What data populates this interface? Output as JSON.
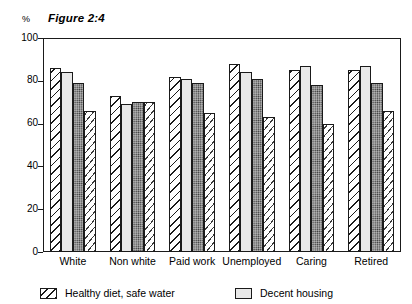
{
  "figure": {
    "title": "Figure 2:4",
    "unit_label": "%"
  },
  "legend": {
    "items": [
      {
        "label": "Healthy diet, safe water",
        "pattern": "diagonal-hatch"
      },
      {
        "label": "Decent housing",
        "pattern": "light-stipple"
      }
    ]
  },
  "axes": {
    "y_ticks": [
      "0",
      "20",
      "40",
      "60",
      "80",
      "100"
    ],
    "x_categories": [
      "White",
      "Non white",
      "Paid work",
      "Unemployed",
      "Caring",
      "Retired"
    ]
  },
  "chart_data": {
    "type": "bar",
    "title": "Figure 2:4",
    "xlabel": "",
    "ylabel": "%",
    "ylim": [
      0,
      100
    ],
    "yticks": [
      0,
      20,
      40,
      60,
      80,
      100
    ],
    "grid": false,
    "legend_position": "bottom-left",
    "categories": [
      "White",
      "Non white",
      "Paid work",
      "Unemployed",
      "Caring",
      "Retired"
    ],
    "series": [
      {
        "name": "Healthy diet, safe water",
        "pattern": "diagonal-hatch",
        "values": [
          86,
          73,
          82,
          88,
          85,
          85
        ]
      },
      {
        "name": "Decent housing",
        "pattern": "light-stipple",
        "values": [
          84,
          69,
          81,
          84,
          87,
          87
        ]
      },
      {
        "name": "Series 3",
        "pattern": "dark-stipple",
        "values": [
          79,
          70,
          79,
          81,
          78,
          79
        ]
      },
      {
        "name": "Series 4",
        "pattern": "sparse-dashes",
        "values": [
          66,
          70,
          65,
          63,
          60,
          66
        ]
      }
    ]
  },
  "colors": {
    "axis": "#1a1a1a",
    "series1_fill": "#ffffff",
    "series2_fill": "#e8e8e8",
    "series3_fill": "#b0b0b0",
    "series4_fill": "#ffffff"
  }
}
